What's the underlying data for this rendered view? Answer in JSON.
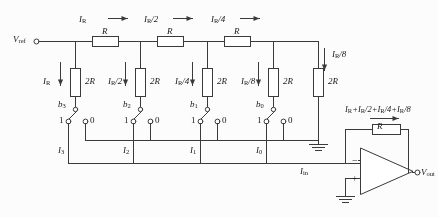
{
  "figure": {
    "type": "circuit-schematic",
    "name": "R-2R ladder DAC with inverting op-amp",
    "width": 438,
    "height": 217,
    "background": "#fcfcfc",
    "ink": "#3a3a3a",
    "text_color": "#1a1a1a"
  },
  "terminals": {
    "vref": "V_ref",
    "vref_html": "V<sub>ref</sub>",
    "vout": "V_out",
    "vout_html": "V<sub>out</sub>"
  },
  "ladder": {
    "series_resistor_label": "R",
    "shunt_resistor_label": "2R",
    "series_currents": [
      "I_R",
      "I_R/2",
      "I_R/4"
    ],
    "series_currents_html": [
      "I<sub>R</sub>",
      "I<sub>R</sub>/2",
      "I<sub>R</sub>/4"
    ],
    "shunt_currents": [
      "I_R",
      "I_R/2",
      "I_R/4",
      "I_R/8"
    ],
    "shunt_currents_html": [
      "I<sub>R</sub>",
      "I<sub>R</sub>/2",
      "I<sub>R</sub>/4",
      "I<sub>R</sub>/8"
    ],
    "termination_current": "I_R/8",
    "termination_current_html": "I<sub>R</sub>/8",
    "termination_resistor_label": "2R",
    "series_count": 3,
    "shunt_count": 5
  },
  "switches": [
    {
      "bit": "b_3",
      "bit_html": "b<sub>3</sub>",
      "pos_label": "1",
      "neg_label": "0",
      "branch_current": "I_3",
      "branch_current_html": "I<sub>3</sub>"
    },
    {
      "bit": "b_2",
      "bit_html": "b<sub>2</sub>",
      "pos_label": "1",
      "neg_label": "0",
      "branch_current": "I_2",
      "branch_current_html": "I<sub>2</sub>"
    },
    {
      "bit": "b_1",
      "bit_html": "b<sub>1</sub>",
      "pos_label": "1",
      "neg_label": "0",
      "branch_current": "I_1",
      "branch_current_html": "I<sub>1</sub>"
    },
    {
      "bit": "b_0",
      "bit_html": "b<sub>0</sub>",
      "pos_label": "1",
      "neg_label": "0",
      "branch_current": "I_0",
      "branch_current_html": "I<sub>0</sub>"
    }
  ],
  "opamp": {
    "inverting_label": "−",
    "noninverting_label": "+",
    "input_current": "I_in",
    "input_current_html": "I<sub>in</sub>",
    "feedback_resistor_label": "R",
    "feedback_current": "I_R+I_R/2+I_R/4+I_R/8",
    "feedback_current_html": "I<sub>R</sub>+I<sub>R</sub>/2+I<sub>R</sub>/4+I<sub>R</sub>/8"
  },
  "grounds": [
    {
      "name": "zero-rail-ground"
    },
    {
      "name": "noninverting-input-ground"
    }
  ]
}
